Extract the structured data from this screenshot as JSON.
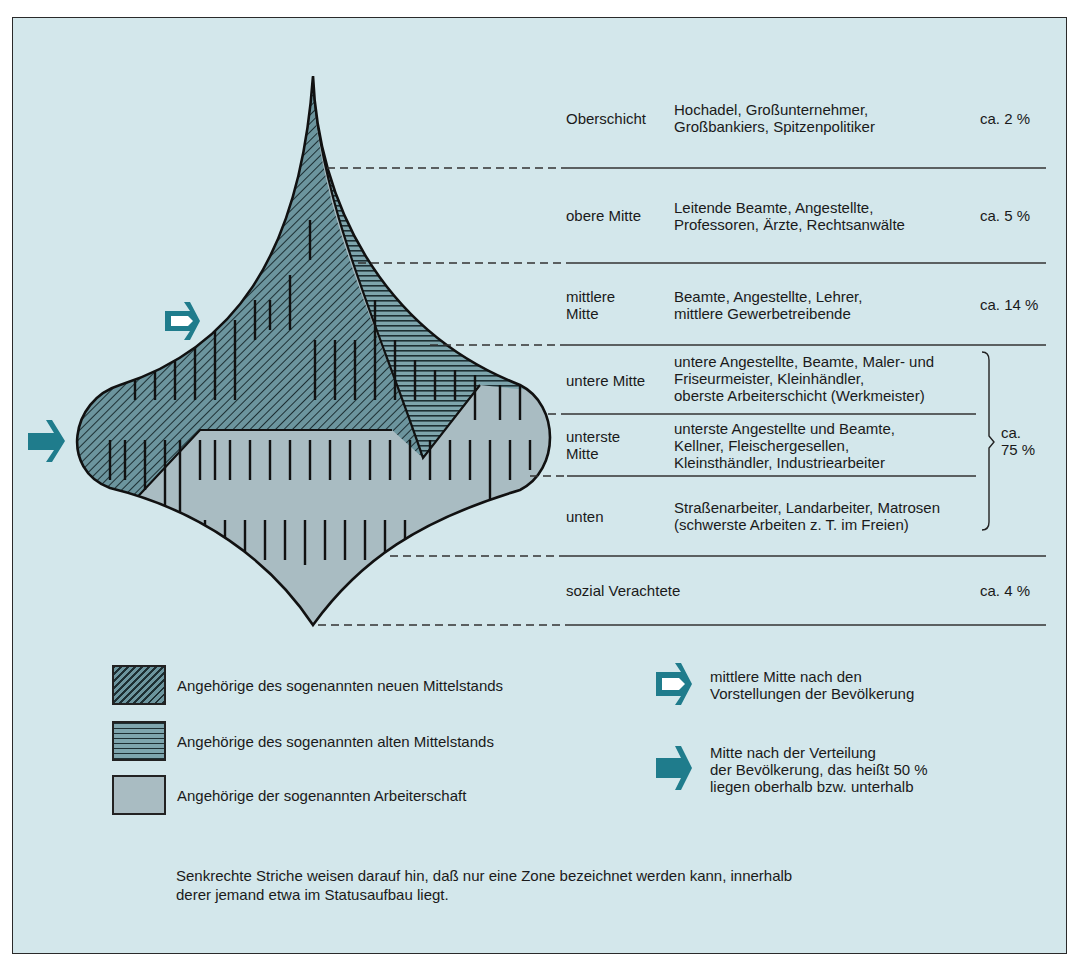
{
  "colors": {
    "background": "#d3e7eb",
    "new_middle_class_fill": "#5f8a93",
    "old_middle_class_fill": "#6f9aa3",
    "working_class_fill": "#a9bcc2",
    "arrow_teal": "#1f7c8c",
    "line": "#222222"
  },
  "levels": [
    {
      "name": "Oberschicht",
      "desc": "Hochadel, Großunternehmer,\nGroßbankiers, Spitzenpolitiker",
      "pct": "ca. 2 %"
    },
    {
      "name": "obere Mitte",
      "desc": "Leitende Beamte, Angestellte,\nProfessoren, Ärzte, Rechtsanwälte",
      "pct": "ca. 5 %"
    },
    {
      "name": "mittlere\nMitte",
      "desc": "Beamte, Angestellte, Lehrer,\nmittlere Gewerbetreibende",
      "pct": "ca. 14 %"
    },
    {
      "name": "untere Mitte",
      "desc": "untere Angestellte, Beamte, Maler- und\nFriseurmeister, Kleinhändler,\noberste Arbeiterschicht (Werkmeister)",
      "pct": ""
    },
    {
      "name": "unterste\nMitte",
      "desc": "unterste Angestellte und Beamte,\nKellner, Fleischergesellen,\nKleinsthändler, Industriearbeiter",
      "pct": ""
    },
    {
      "name": "unten",
      "desc": "Straßenarbeiter, Landarbeiter, Matrosen\n(schwerste Arbeiten z. T. im Freien)",
      "pct": ""
    },
    {
      "name": "sozial Verachtete",
      "desc": "",
      "pct": "ca. 4 %"
    }
  ],
  "bracket_group": {
    "label": "ca.\n75 %",
    "covers": [
      "untere Mitte",
      "unterste Mitte",
      "unten"
    ]
  },
  "legend": {
    "patterns": [
      {
        "icon": "diagonal-hatch-swatch",
        "label": "Angehörige des sogenannten neuen Mittelstands"
      },
      {
        "icon": "horizontal-hatch-swatch",
        "label": "Angehörige des sogenannten alten Mittelstands"
      },
      {
        "icon": "solid-gray-swatch",
        "label": "Angehörige der sogenannten Arbeiterschaft"
      }
    ],
    "arrows": [
      {
        "icon": "open-arrow-icon",
        "label": "mittlere Mitte nach den\nVorstellungen der Bevölkerung"
      },
      {
        "icon": "solid-arrow-icon",
        "label": "Mitte nach der Verteilung\nder Bevölkerung, das heißt 50 %\nliegen oberhalb bzw. unterhalb"
      }
    ]
  },
  "note": "Senkrechte Striche weisen darauf hin, daß nur eine Zone bezeichnet werden kann, innerhalb\nderer jemand etwa im Statusaufbau liegt."
}
